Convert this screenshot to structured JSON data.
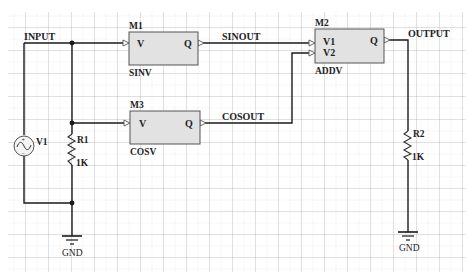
{
  "schematic": {
    "grid": {
      "major_spacing": 23,
      "minor_color": "#c8c8c8",
      "major_color": "#a8a8a8"
    },
    "colors": {
      "wire": "#1a1a1a",
      "block_fill": "#e2e2e2",
      "block_stroke": "#555555",
      "background": "#ffffff"
    },
    "nets": {
      "input": "INPUT",
      "sinout": "SINOUT",
      "cosout": "COSOUT",
      "output": "OUTPUT"
    },
    "blocks": [
      {
        "ref": "M1",
        "type": "SINV",
        "inputs": [
          "V"
        ],
        "output": "Q"
      },
      {
        "ref": "M3",
        "type": "COSV",
        "inputs": [
          "V"
        ],
        "output": "Q"
      },
      {
        "ref": "M2",
        "type": "ADDV",
        "inputs": [
          "V1",
          "V2"
        ],
        "output": "Q"
      }
    ],
    "source": {
      "ref": "V1",
      "icon": "ac-source-icon",
      "plus": "+",
      "minus": "−"
    },
    "resistors": [
      {
        "ref": "R1",
        "value": "1K"
      },
      {
        "ref": "R2",
        "value": "1K"
      }
    ],
    "grounds": [
      {
        "label": "GND"
      },
      {
        "label": "GND"
      }
    ]
  }
}
